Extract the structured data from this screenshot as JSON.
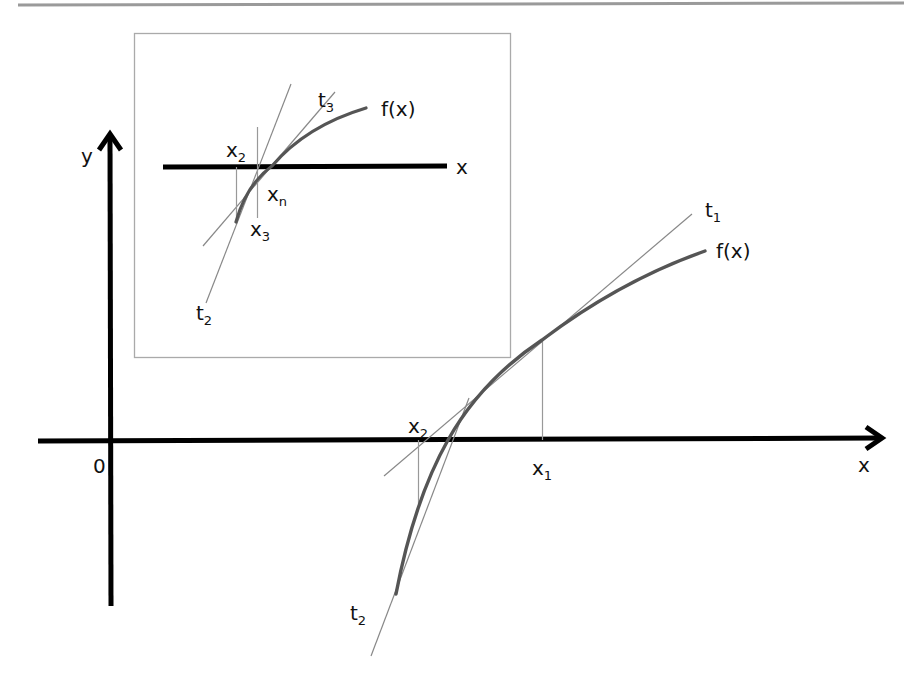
{
  "figure": {
    "colors": {
      "axis": "#000000",
      "curve": "#555555",
      "tangent": "#888888",
      "guide": "#999999",
      "inset_border": "#aaaaaa",
      "top_rule": "#9a9a9a"
    }
  },
  "main": {
    "y_axis_label": "y",
    "x_axis_label": "x",
    "origin_label": "0",
    "curve_label": "f(x)",
    "tangent1": {
      "base": "t",
      "sub": "1"
    },
    "tangent2": {
      "base": "t",
      "sub": "2"
    },
    "point_x1": {
      "base": "x",
      "sub": "1"
    },
    "point_x2": {
      "base": "x",
      "sub": "2"
    }
  },
  "inset": {
    "x_axis_label": "x",
    "curve_label": "f(x)",
    "tangent2": {
      "base": "t",
      "sub": "2"
    },
    "tangent3": {
      "base": "t",
      "sub": "3"
    },
    "point_x2": {
      "base": "x",
      "sub": "2"
    },
    "point_x3": {
      "base": "x",
      "sub": "3"
    },
    "point_xn": {
      "base": "x",
      "sub": "n"
    }
  }
}
